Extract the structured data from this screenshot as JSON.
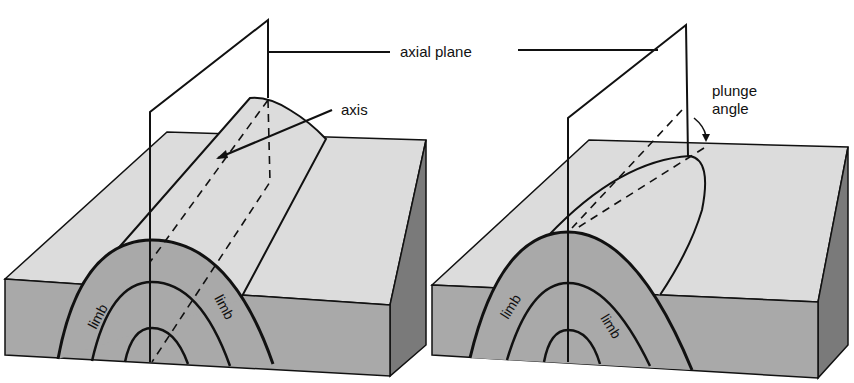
{
  "figure": {
    "colors": {
      "background": "#ffffff",
      "top_surface": "#dcdcdc",
      "front_face": "#a9a9a9",
      "side_face": "#7a7a7a",
      "line": "#111111"
    },
    "labels": {
      "axial_plane": "axial plane",
      "axis": "axis",
      "plunge_line1": "plunge",
      "plunge_line2": "angle",
      "left_limb_a": "limb",
      "left_limb_b": "limb",
      "right_limb_a": "limb",
      "right_limb_b": "limb"
    },
    "panels": [
      {
        "name": "non-plunging anticline",
        "features": [
          "axial plane",
          "axis",
          "limb",
          "limb"
        ]
      },
      {
        "name": "plunging anticline",
        "features": [
          "axial plane",
          "plunge angle",
          "limb",
          "limb"
        ]
      }
    ]
  }
}
